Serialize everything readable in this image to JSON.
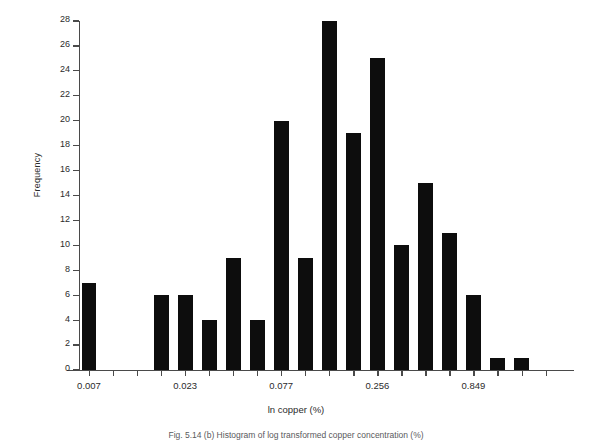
{
  "figure": {
    "ylabel": "Frequency",
    "xlabel": "ln copper (%)",
    "caption": "Fig. 5.14  (b) Histogram of log transformed copper concentration (%)"
  },
  "chart_data": {
    "type": "bar",
    "title": "",
    "subtitle": "",
    "xlabel": "ln copper (%)",
    "ylabel": "Frequency",
    "ylim": [
      0,
      28
    ],
    "ytick_step": 2,
    "yticks": [
      0,
      2,
      4,
      6,
      8,
      10,
      12,
      14,
      16,
      18,
      20,
      22,
      24,
      26,
      28
    ],
    "ytick_labels": [
      "0",
      "2",
      "4",
      "6",
      "8",
      "10",
      "12",
      "14",
      "16",
      "18",
      "20",
      "22",
      "24",
      "26",
      "28"
    ],
    "grid": false,
    "legend": null,
    "bar_color": "#0d0d0d",
    "axis_color": "#4a4a4a",
    "n_bins": 20,
    "bin_indices": [
      0,
      1,
      2,
      3,
      4,
      5,
      6,
      7,
      8,
      9,
      10,
      11,
      12,
      13,
      14,
      15,
      16,
      17,
      18,
      19
    ],
    "values": [
      7,
      0,
      0,
      6,
      6,
      4,
      9,
      4,
      20,
      9,
      28,
      19,
      25,
      10,
      15,
      11,
      6,
      1,
      1,
      0
    ],
    "xtick_positions": [
      0,
      3,
      6,
      10,
      14,
      18
    ],
    "xtick_labels": [
      "0.007",
      "",
      "0.023",
      "",
      "0.077",
      ""
    ],
    "xaxis_labeled_ticks": [
      {
        "bin": 0,
        "label": "0.007"
      },
      {
        "bin": 4,
        "label": "0.023"
      },
      {
        "bin": 8,
        "label": "0.077"
      },
      {
        "bin": 12,
        "label": "0.256"
      },
      {
        "bin": 16,
        "label": "0.849"
      }
    ]
  }
}
